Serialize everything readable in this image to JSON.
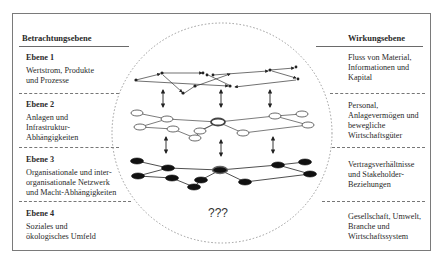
{
  "left_column": {
    "header": "Betrachtungsebene",
    "levels": [
      {
        "title": "Ebene 1",
        "lines": [
          "Wertstrom, Produkte",
          "und Prozesse"
        ]
      },
      {
        "title": "Ebene 2",
        "lines": [
          "Anlagen und",
          "Infrastruktur-",
          "Abhängigkeiten"
        ]
      },
      {
        "title": "Ebene 3",
        "lines": [
          "Organisationale und inter-",
          "organisationale Netzwerk",
          "und Macht-Abhängigkeiten"
        ]
      },
      {
        "title": "Ebene 4",
        "lines": [
          "Soziales und",
          "ökologisches Umfeld"
        ]
      }
    ]
  },
  "right_column": {
    "header": "Wirkungsebene",
    "levels": [
      {
        "lines": [
          "Fluss von Material,",
          "Informationen und",
          "Kapital"
        ]
      },
      {
        "lines": [
          "Personal,",
          "Anlagevermögen und",
          "bewegliche",
          "Wirtschaftsgüter"
        ]
      },
      {
        "lines": [
          "Vertragsverhältnisse",
          "und Stakeholder-",
          "Beziehungen"
        ]
      },
      {
        "lines": [
          "Gesellschaft, Umwelt,",
          "Branche und",
          "Wirtschaftssystem"
        ]
      }
    ]
  },
  "center": {
    "unknown_label": "???",
    "layers": [
      "process-network",
      "asset-network",
      "organisation-network",
      "unknown"
    ]
  },
  "colors": {
    "border": "#7a7a7a",
    "text": "#2a2a2a",
    "dotted_circle": "#9a9a9a",
    "node_fill_dark": "#111111",
    "node_fill_light": "#ffffff"
  }
}
